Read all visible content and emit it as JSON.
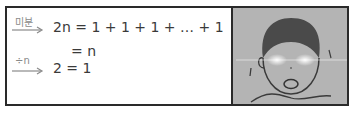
{
  "panel_left": {
    "arrow1_label": "미분",
    "line1": "2n = 1 + 1 + 1 + … + 1",
    "line2": "= n",
    "arrow2_label": "÷n",
    "line3": "2 = 1"
  },
  "panel_right": {
    "image": "shocked-boy-glowing-eyes"
  },
  "colors": {
    "border": "#2a2a2a",
    "panel_bg": "#b4b4b4",
    "text": "#3a3a3a",
    "arrow_label": "#8a8a8a"
  }
}
